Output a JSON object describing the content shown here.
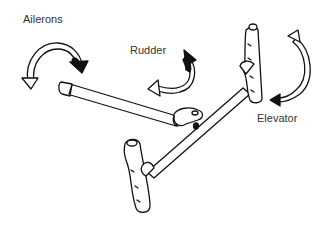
{
  "diagram": {
    "type": "control-stick-illustration",
    "labels": {
      "ailerons": "Ailerons",
      "rudder": "Rudder",
      "elevator": "Elevator"
    },
    "colors": {
      "line": "#111111",
      "fill": "#ffffff",
      "text": "#333333",
      "background": "#ffffff"
    }
  }
}
